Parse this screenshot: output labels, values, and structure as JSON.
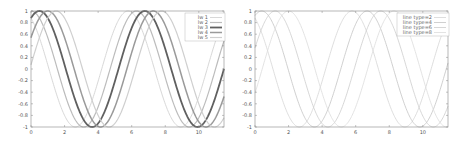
{
  "chart_data": [
    {
      "type": "line",
      "title": "",
      "xlabel": "",
      "ylabel": "",
      "xlim": [
        0,
        11.5
      ],
      "ylim": [
        -1,
        1
      ],
      "x_ticks": [
        "0",
        "2",
        "4",
        "6",
        "8",
        "10"
      ],
      "y_ticks": [
        "1",
        "0.8",
        "0.6",
        "0.4",
        "0.2",
        "0",
        "-0.2",
        "-0.4",
        "-0.6",
        "-0.8",
        "-1"
      ],
      "grid": false,
      "legend_position": "top-right",
      "function": "cos(x - phase)",
      "series": [
        {
          "name": "lw 1",
          "phase": -0.5,
          "color": "#d8d8d8",
          "width": 1
        },
        {
          "name": "lw 2",
          "phase": 0.0,
          "color": "#bcbcbc",
          "width": 1.2
        },
        {
          "name": "lw 3",
          "phase": 0.5,
          "color": "#606060",
          "width": 1.8
        },
        {
          "name": "lw 4",
          "phase": 1.0,
          "color": "#9a9a9a",
          "width": 1.5
        },
        {
          "name": "lw 5",
          "phase": 1.5,
          "color": "#cfcfcf",
          "width": 1.2
        }
      ]
    },
    {
      "type": "line",
      "title": "",
      "xlabel": "",
      "ylabel": "",
      "xlim": [
        0,
        11.5
      ],
      "ylim": [
        -1,
        1
      ],
      "x_ticks": [
        "0",
        "2",
        "4",
        "6",
        "8",
        "10"
      ],
      "y_ticks": [
        "1",
        "0.8",
        "0.6",
        "0.4",
        "0.2",
        "0",
        "-0.2",
        "-0.4",
        "-0.6",
        "-0.8",
        "-1"
      ],
      "grid": false,
      "legend_position": "top-right",
      "function": "cos(x - phase)",
      "series": [
        {
          "name": "line type=2",
          "phase": -0.5,
          "color": "#d6d6d6",
          "width": 0.8
        },
        {
          "name": "line type=4",
          "phase": 0.4,
          "color": "#c4c4c4",
          "width": 0.8
        },
        {
          "name": "line type=6",
          "phase": 1.2,
          "color": "#cdcdcd",
          "width": 0.8
        },
        {
          "name": "line type=8",
          "phase": 2.0,
          "color": "#dcdcdc",
          "width": 0.8
        }
      ]
    }
  ]
}
